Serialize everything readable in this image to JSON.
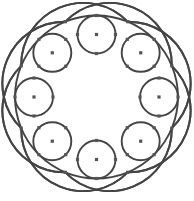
{
  "figure": {
    "title": "",
    "center": [
      96.5,
      97
    ],
    "outer_radius": 81.5,
    "small_circle_count": 8,
    "small_circle_orbit": 62.5,
    "small_circle_radius": 19,
    "arc_point_count": 8,
    "arc_point_offset_deg": 22.5,
    "arc_radius": 62,
    "stroke_color": "#444444",
    "dot_color": "#555555",
    "dot_size": 3.2
  }
}
